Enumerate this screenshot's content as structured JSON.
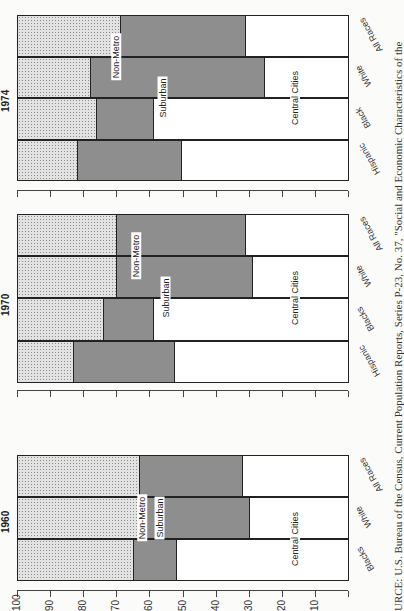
{
  "chart_data": [
    {
      "type": "bar",
      "orientation": "stacked-horizontal (page rotated 90°)",
      "title": "1974",
      "categories": [
        "All Races",
        "White",
        "Black",
        "Hispanic"
      ],
      "series": [
        {
          "name": "Non-Metro",
          "values": [
            31,
            22,
            24,
            18
          ]
        },
        {
          "name": "Suburban",
          "values": [
            38,
            52.5,
            17,
            31.5
          ]
        },
        {
          "name": "Central Cities",
          "values": [
            31,
            25.5,
            59,
            50.5
          ]
        }
      ],
      "xlabel": "",
      "ylabel": "Percent",
      "ylim": [
        0,
        100
      ],
      "ticks": [
        100,
        90,
        80,
        70,
        60,
        50,
        40,
        30,
        20,
        10
      ]
    },
    {
      "type": "bar",
      "orientation": "stacked-horizontal (page rotated 90°)",
      "title": "1970",
      "categories": [
        "All Races",
        "White",
        "Blacks",
        "Hispanic"
      ],
      "series": [
        {
          "name": "Non-Metro",
          "values": [
            30,
            30,
            26,
            17
          ]
        },
        {
          "name": "Suburban",
          "values": [
            39,
            41,
            15,
            30.5
          ]
        },
        {
          "name": "Central Cities",
          "values": [
            31,
            29,
            59,
            52.5
          ]
        }
      ],
      "xlabel": "",
      "ylabel": "Percent",
      "ylim": [
        0,
        100
      ],
      "ticks": [
        100,
        90,
        80,
        70,
        60,
        50,
        40,
        30,
        20,
        10
      ]
    },
    {
      "type": "bar",
      "orientation": "stacked-horizontal (page rotated 90°)",
      "title": "1960",
      "categories": [
        "All Races",
        "White",
        "Blacks"
      ],
      "series": [
        {
          "name": "Non-Metro",
          "values": [
            37,
            38,
            35
          ]
        },
        {
          "name": "Suburban",
          "values": [
            31,
            32,
            13
          ]
        },
        {
          "name": "Central Cities",
          "values": [
            32,
            30,
            52
          ]
        }
      ],
      "xlabel": "",
      "ylabel": "Percent",
      "ylim": [
        0,
        100
      ],
      "ticks": [
        100,
        90,
        80,
        70,
        60,
        50,
        40,
        30,
        20,
        10
      ]
    }
  ],
  "labels": {
    "nonmetro": "Non-Metro",
    "suburban": "Suburban",
    "central": "Central Cities"
  },
  "panels": {
    "p1974": {
      "year": "1974",
      "cats": [
        "All Races",
        "White",
        "Black",
        "Hispanic"
      ]
    },
    "p1970": {
      "year": "1970",
      "cats": [
        "All Races",
        "White",
        "Blacks",
        "Hispanic"
      ]
    },
    "p1960": {
      "year": "1960",
      "cats": [
        "All Races",
        "White",
        "Blacks"
      ]
    }
  },
  "axis_ticks": [
    "100",
    "90",
    "80",
    "70",
    "60",
    "50",
    "40",
    "30",
    "20",
    "10"
  ],
  "caption": "URCE: U.S. Bureau of the Census, Current Population Reports, Series P-23, No. 37, \"Social and Economic Characteristics of the"
}
